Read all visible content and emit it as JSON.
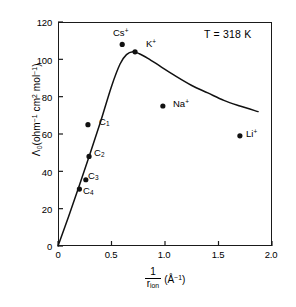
{
  "chart_data": {
    "type": "scatter",
    "title": "",
    "xlabel": "1/r_ion (Å^-1)",
    "ylabel": "Λ0 (ohm^-1 cm^2 mol^-1)",
    "xlim": [
      0,
      2.0
    ],
    "ylim": [
      0,
      120
    ],
    "xticks": [
      "0",
      "0.5",
      "1.0",
      "1.5",
      "2.0"
    ],
    "xtick_values": [
      0,
      0.5,
      1.0,
      1.5,
      2.0
    ],
    "yticks": [
      "0",
      "20",
      "40",
      "60",
      "80",
      "100",
      "120"
    ],
    "ytick_values": [
      0,
      20,
      40,
      60,
      80,
      100,
      120
    ],
    "grid": false,
    "legend": "none",
    "annotations": [
      {
        "text": "T = 318 K",
        "x": 1.45,
        "y": 112
      }
    ],
    "points": [
      {
        "label": "Cs+",
        "label_text": "Cs",
        "charge": "+",
        "x": 0.6,
        "y": 108.0,
        "label_dx": -6,
        "label_dy": -13
      },
      {
        "label": "K+",
        "label_text": "K",
        "charge": "+",
        "x": 0.72,
        "y": 104.0,
        "label_dx": 6,
        "label_dy": -9
      },
      {
        "label": "Na+",
        "label_text": "Na",
        "charge": "+",
        "x": 0.98,
        "y": 75.0,
        "label_dx": 6,
        "label_dy": -5
      },
      {
        "label": "Li+",
        "label_text": "Li",
        "charge": "+",
        "x": 1.7,
        "y": 59.0,
        "label_dx": 6,
        "label_dy": -5
      },
      {
        "label": "C1",
        "label_text": "C",
        "charge": "1",
        "x": 0.28,
        "y": 65.0,
        "label_dx": 10,
        "label_dy": -3
      },
      {
        "label": "C2",
        "label_text": "C",
        "charge": "2",
        "x": 0.29,
        "y": 48.0,
        "label_dx": 7,
        "label_dy": -2
      },
      {
        "label": "C3",
        "label_text": "C",
        "charge": "3",
        "x": 0.26,
        "y": 35.5,
        "label_dx": 6,
        "label_dy": -1
      },
      {
        "label": "C4",
        "label_text": "C",
        "charge": "4",
        "x": 0.2,
        "y": 30.5,
        "label_dx": 5,
        "label_dy": 4
      }
    ],
    "curve": {
      "name": "fitted-trend",
      "x": [
        0.0,
        0.1,
        0.2,
        0.3,
        0.4,
        0.5,
        0.58,
        0.64,
        0.7,
        0.76,
        0.84,
        0.95,
        1.1,
        1.25,
        1.4,
        1.55,
        1.7,
        1.87
      ],
      "y": [
        0.0,
        16.0,
        32.5,
        49.5,
        67.0,
        85.5,
        97.5,
        102.5,
        104.0,
        103.0,
        100.5,
        96.5,
        91.0,
        86.0,
        82.0,
        78.0,
        75.0,
        72.0
      ]
    }
  }
}
